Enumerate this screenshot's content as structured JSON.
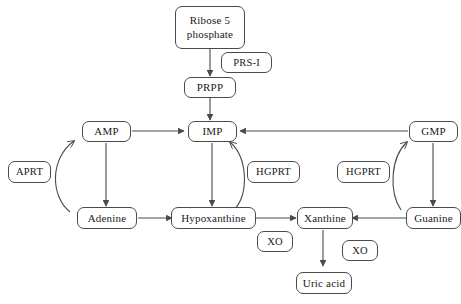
{
  "diagram": {
    "type": "flowchart",
    "background_color": "#ffffff",
    "line_color": "#4a4a4a",
    "text_color": "#1a1a1a"
  },
  "nodes": {
    "ribose5phosphate": {
      "line1": "Ribose 5",
      "line2": "phosphate",
      "kind": "metabolite"
    },
    "prs1": {
      "label": "PRS-I",
      "kind": "enzyme"
    },
    "prpp": {
      "label": "PRPP",
      "kind": "metabolite"
    },
    "amp": {
      "label": "AMP",
      "kind": "metabolite"
    },
    "imp": {
      "label": "IMP",
      "kind": "metabolite"
    },
    "gmp": {
      "label": "GMP",
      "kind": "metabolite"
    },
    "aprt": {
      "label": "APRT",
      "kind": "enzyme"
    },
    "hgprt_center": {
      "label": "HGPRT",
      "kind": "enzyme"
    },
    "hgprt_right": {
      "label": "HGPRT",
      "kind": "enzyme"
    },
    "adenine": {
      "label": "Adenine",
      "kind": "metabolite"
    },
    "hypoxanthine": {
      "label": "Hypoxanthine",
      "kind": "metabolite"
    },
    "xanthine": {
      "label": "Xanthine",
      "kind": "metabolite"
    },
    "guanine": {
      "label": "Guanine",
      "kind": "metabolite"
    },
    "xo_left": {
      "label": "XO",
      "kind": "enzyme"
    },
    "xo_right": {
      "label": "XO",
      "kind": "enzyme"
    },
    "uric_acid": {
      "label": "Uric acid",
      "kind": "metabolite"
    }
  },
  "edges": [
    {
      "name": "ribose5phosphate-to-prpp",
      "from": "ribose5phosphate",
      "to": "prpp",
      "style": "straight-arrow",
      "enzyme": "prs1"
    },
    {
      "name": "prpp-to-imp",
      "from": "prpp",
      "to": "imp",
      "style": "straight-arrow"
    },
    {
      "name": "amp-to-imp",
      "from": "amp",
      "to": "imp",
      "style": "straight-arrow"
    },
    {
      "name": "gmp-to-imp",
      "from": "gmp",
      "to": "imp",
      "style": "straight-arrow"
    },
    {
      "name": "amp-to-adenine",
      "from": "amp",
      "to": "adenine",
      "style": "straight-arrow"
    },
    {
      "name": "imp-to-hypoxanthine",
      "from": "imp",
      "to": "hypoxanthine",
      "style": "straight-arrow"
    },
    {
      "name": "gmp-to-guanine",
      "from": "gmp",
      "to": "guanine",
      "style": "straight-arrow"
    },
    {
      "name": "adenine-to-amp-salvage",
      "from": "adenine",
      "to": "amp",
      "style": "curved-arrow",
      "enzyme": "aprt"
    },
    {
      "name": "hypoxanthine-to-imp-salvage",
      "from": "hypoxanthine",
      "to": "imp",
      "style": "curved-arrow",
      "enzyme": "hgprt_center"
    },
    {
      "name": "guanine-to-gmp-salvage",
      "from": "guanine",
      "to": "gmp",
      "style": "curved-arrow",
      "enzyme": "hgprt_right"
    },
    {
      "name": "adenine-to-hypoxanthine",
      "from": "adenine",
      "to": "hypoxanthine",
      "style": "straight-arrow"
    },
    {
      "name": "hypoxanthine-to-xanthine",
      "from": "hypoxanthine",
      "to": "xanthine",
      "style": "straight-arrow",
      "enzyme": "xo_left"
    },
    {
      "name": "guanine-to-xanthine",
      "from": "guanine",
      "to": "xanthine",
      "style": "straight-arrow"
    },
    {
      "name": "xanthine-to-uric-acid",
      "from": "xanthine",
      "to": "uric_acid",
      "style": "straight-arrow",
      "enzyme": "xo_right"
    }
  ]
}
